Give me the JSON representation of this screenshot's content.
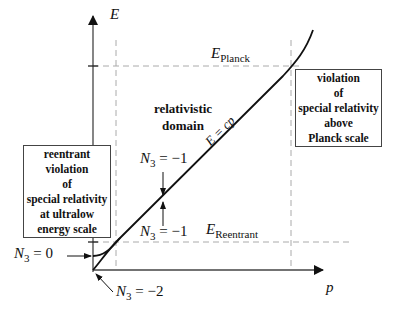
{
  "axes": {
    "y_label": "E",
    "x_label": "p"
  },
  "levels": {
    "planck": {
      "symbol": "E",
      "subscript": "Planck"
    },
    "reentrant": {
      "symbol": "E",
      "subscript": "Reentrant"
    }
  },
  "line_label": "E = cp",
  "regions": {
    "middle": [
      "relativistic",
      "domain"
    ],
    "upper_box": [
      "violation",
      "of",
      "special relativity",
      "above",
      "Planck scale"
    ],
    "lower_box": [
      "reentrant",
      "violation",
      "of",
      "special relativity",
      "at ultralow",
      "energy scale"
    ]
  },
  "annotations": {
    "n3_upper": {
      "symbol": "N",
      "sub": "3",
      "rest": " = −1"
    },
    "n3_lower": {
      "symbol": "N",
      "sub": "3",
      "rest": " = −1"
    },
    "n3_zero": {
      "symbol": "N",
      "sub": "3",
      "rest": " = 0"
    },
    "n3_minus2": {
      "symbol": "N",
      "sub": "3",
      "rest": " = −2"
    }
  },
  "colors": {
    "curve": "#111111",
    "axis": "#444444",
    "dashed": "#aaaaaa"
  }
}
